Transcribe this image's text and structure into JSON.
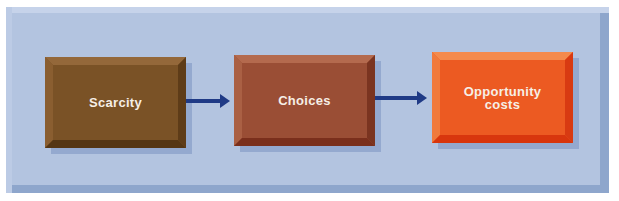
{
  "diagram": {
    "type": "flowchart",
    "nodes": [
      {
        "id": "scarcity",
        "label": "Scarcity",
        "color": "#7a5226"
      },
      {
        "id": "choices",
        "label": "Choices",
        "color": "#9a4e35"
      },
      {
        "id": "opportunity_costs",
        "label": "Opportunity costs",
        "line1": "Opportunity",
        "line2": "costs",
        "color": "#ec5a22"
      }
    ],
    "edges": [
      {
        "from": "scarcity",
        "to": "choices"
      },
      {
        "from": "choices",
        "to": "opportunity_costs"
      }
    ],
    "colors": {
      "background_panel": "#b3c4e0",
      "arrow": "#1f3a86"
    }
  }
}
